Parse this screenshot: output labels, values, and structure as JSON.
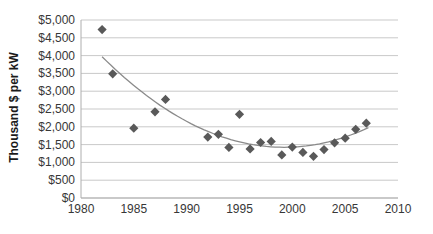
{
  "chart_data": {
    "type": "scatter",
    "title": "",
    "xlabel": "",
    "ylabel": "Thousand $ per kW",
    "xlim": [
      1980,
      2010
    ],
    "ylim": [
      0,
      5000
    ],
    "grid": "horizontal-only",
    "legend": "none",
    "marker": "diamond",
    "x_tick_values": [
      1980,
      1985,
      1990,
      1995,
      2000,
      2005,
      2010
    ],
    "x_tick_labels": [
      "1980",
      "1985",
      "1990",
      "1995",
      "2000",
      "2005",
      "2010"
    ],
    "y_tick_values": [
      0,
      500,
      1000,
      1500,
      2000,
      2500,
      3000,
      3500,
      4000,
      4500,
      5000
    ],
    "y_tick_labels": [
      "$0",
      "$500",
      "$1,000",
      "$1,500",
      "$2,000",
      "$2,500",
      "$3,000",
      "$3,500",
      "$4,000",
      "$4,500",
      "$5,000"
    ],
    "series": [
      {
        "name": "cost-per-kw-observations",
        "points": [
          [
            1982,
            4730
          ],
          [
            1983,
            3490
          ],
          [
            1985,
            1960
          ],
          [
            1987,
            2420
          ],
          [
            1988,
            2770
          ],
          [
            1992,
            1710
          ],
          [
            1993,
            1790
          ],
          [
            1994,
            1420
          ],
          [
            1995,
            2350
          ],
          [
            1996,
            1380
          ],
          [
            1997,
            1560
          ],
          [
            1998,
            1590
          ],
          [
            1999,
            1210
          ],
          [
            2000,
            1430
          ],
          [
            2001,
            1280
          ],
          [
            2002,
            1170
          ],
          [
            2003,
            1360
          ],
          [
            2004,
            1550
          ],
          [
            2005,
            1680
          ],
          [
            2006,
            1930
          ],
          [
            2007,
            2100
          ]
        ]
      }
    ],
    "trendline": {
      "type": "polynomial",
      "order": 2,
      "vertex_x": 1999.2,
      "vertex_y": 1425,
      "a": 8.6,
      "x_start": 1982,
      "x_end": 2007.2
    },
    "colors": {
      "marker": "#595959",
      "trendline": "#8a8a8a",
      "gridline": "#c9c9c9",
      "axis": "#aeaeae",
      "tick_text": "#373737",
      "background": "#ffffff"
    }
  }
}
